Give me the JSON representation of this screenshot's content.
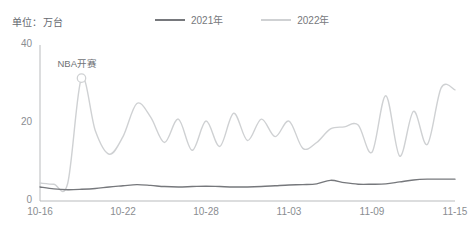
{
  "unit_label": "单位：万台",
  "legend": {
    "position": "top-center",
    "items": [
      {
        "label": "2021年",
        "color": "#76787c"
      },
      {
        "label": "2022年",
        "color": "#cfd1d3"
      }
    ]
  },
  "annotations": [
    {
      "text": "NBA开赛",
      "x_index": 3,
      "value": 31.5,
      "marker": "circle"
    }
  ],
  "axes": {
    "y_ticks": [
      "0",
      "20",
      "40"
    ],
    "x_ticks": [
      "10-16",
      "10-22",
      "10-28",
      "11-03",
      "11-09",
      "11-15"
    ]
  },
  "chart_data": {
    "type": "line",
    "title": "",
    "subtitle": "",
    "xlabel": "",
    "ylabel": "万台",
    "ylim": [
      0,
      40
    ],
    "yticks": [
      0,
      20,
      40
    ],
    "grid": false,
    "legend_position": "top-center",
    "x": [
      "10-16",
      "10-17",
      "10-18",
      "10-19",
      "10-20",
      "10-21",
      "10-22",
      "10-23",
      "10-24",
      "10-25",
      "10-26",
      "10-27",
      "10-28",
      "10-29",
      "10-30",
      "10-31",
      "11-01",
      "11-02",
      "11-03",
      "11-04",
      "11-05",
      "11-06",
      "11-07",
      "11-08",
      "11-09",
      "11-10",
      "11-11",
      "11-12",
      "11-13",
      "11-14",
      "11-15"
    ],
    "xticks": [
      "10-16",
      "10-22",
      "10-28",
      "11-03",
      "11-09",
      "11-15"
    ],
    "series": [
      {
        "name": "2021年",
        "color": "#76787c",
        "values": [
          3.6,
          3.1,
          2.9,
          3.0,
          3.2,
          3.6,
          3.9,
          4.2,
          4.0,
          3.7,
          3.6,
          3.7,
          3.8,
          3.7,
          3.6,
          3.6,
          3.7,
          3.9,
          4.1,
          4.2,
          4.4,
          5.3,
          4.7,
          4.3,
          4.3,
          4.4,
          4.9,
          5.4,
          5.6,
          5.6,
          5.6
        ]
      },
      {
        "name": "2022年",
        "color": "#cfd1d3",
        "values": [
          4.6,
          4.3,
          4.5,
          31.5,
          18.0,
          12.0,
          16.5,
          25.0,
          21.5,
          15.0,
          21.0,
          13.0,
          20.5,
          14.0,
          22.5,
          15.5,
          21.0,
          16.5,
          20.5,
          13.5,
          15.0,
          18.5,
          19.0,
          19.5,
          12.5,
          27.0,
          11.5,
          23.0,
          14.5,
          29.0,
          28.5
        ]
      }
    ],
    "annotations": [
      {
        "text": "NBA开赛",
        "x": "10-19",
        "y": 31.5
      }
    ]
  }
}
